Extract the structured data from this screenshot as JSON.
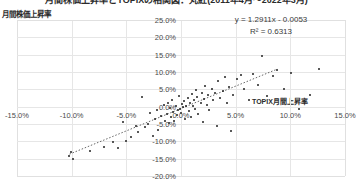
{
  "chart_data": {
    "type": "scatter",
    "title": "月間株価上昇率とTOPIXの相関図：丸紅(2011年4月～2022年3月)",
    "xlabel": "TOPIX月間上昇率",
    "ylabel": "月間株価上昇率",
    "xlim": [
      -0.15,
      0.15
    ],
    "ylim": [
      -0.2,
      0.25
    ],
    "xticks": [
      "-15.0%",
      "-10.0%",
      "-5.0%",
      "0.0%",
      "5.0%",
      "10.0%",
      "15.0%"
    ],
    "xtick_values": [
      -0.15,
      -0.1,
      -0.05,
      0.0,
      0.05,
      0.1,
      0.15
    ],
    "yticks": [
      "25.0%",
      "20.0%",
      "15.0%",
      "10.0%",
      "5.0%",
      "0.0%",
      "-5.0%",
      "-10.0%",
      "-15.0%",
      "-20.0%"
    ],
    "ytick_values": [
      0.25,
      0.2,
      0.15,
      0.1,
      0.05,
      0.0,
      -0.05,
      -0.1,
      -0.15,
      -0.2
    ],
    "grid": true,
    "legend": "none",
    "annotations": {
      "equation": "y = 1.2911x - 0.0053",
      "r_squared": "R² = 0.6313"
    },
    "trendline": {
      "type": "linear",
      "slope": 1.2911,
      "intercept": -0.0053,
      "r2": 0.6313,
      "style": "dotted",
      "x_start": -0.102,
      "x_end": 0.088
    },
    "series": [
      {
        "name": "丸紅 月間株価上昇率 vs TOPIX月間上昇率",
        "marker": "dot",
        "color": "#222222",
        "points": [
          [
            -0.102,
            -0.142
          ],
          [
            -0.101,
            -0.131
          ],
          [
            -0.099,
            -0.152
          ],
          [
            -0.083,
            -0.128
          ],
          [
            -0.07,
            -0.116
          ],
          [
            -0.062,
            -0.102
          ],
          [
            -0.058,
            -0.119
          ],
          [
            -0.053,
            -0.045
          ],
          [
            -0.05,
            -0.098
          ],
          [
            -0.046,
            -0.088
          ],
          [
            -0.041,
            -0.056
          ],
          [
            -0.039,
            -0.072
          ],
          [
            -0.036,
            0.028
          ],
          [
            -0.033,
            -0.06
          ],
          [
            -0.03,
            -0.05
          ],
          [
            -0.028,
            -0.019
          ],
          [
            -0.026,
            -0.086
          ],
          [
            -0.024,
            -0.035
          ],
          [
            -0.022,
            -0.009
          ],
          [
            -0.021,
            -0.066
          ],
          [
            -0.018,
            -0.028
          ],
          [
            -0.016,
            0.005
          ],
          [
            -0.015,
            -0.042
          ],
          [
            -0.013,
            -0.022
          ],
          [
            -0.012,
            0.012
          ],
          [
            -0.011,
            -0.048
          ],
          [
            -0.01,
            -0.004
          ],
          [
            -0.009,
            -0.031
          ],
          [
            -0.008,
            0.02
          ],
          [
            -0.007,
            -0.016
          ],
          [
            -0.006,
            -0.04
          ],
          [
            -0.005,
            0.002
          ],
          [
            -0.004,
            -0.025
          ],
          [
            -0.003,
            -0.011
          ],
          [
            -0.002,
            0.03
          ],
          [
            -0.001,
            -0.006
          ],
          [
            0.0,
            -0.018
          ],
          [
            0.001,
            0.008
          ],
          [
            0.002,
            -0.002
          ],
          [
            0.003,
            0.016
          ],
          [
            0.004,
            -0.037
          ],
          [
            0.005,
            0.001
          ],
          [
            0.006,
            0.024
          ],
          [
            0.007,
            -0.013
          ],
          [
            0.008,
            0.01
          ],
          [
            0.009,
            -0.029
          ],
          [
            0.01,
            0.036
          ],
          [
            0.011,
            0.003
          ],
          [
            0.012,
            0.018
          ],
          [
            0.013,
            -0.008
          ],
          [
            0.014,
            0.048
          ],
          [
            0.015,
            0.027
          ],
          [
            0.016,
            -0.02
          ],
          [
            0.018,
            0.012
          ],
          [
            0.019,
            0.04
          ],
          [
            0.02,
            -0.044
          ],
          [
            0.021,
            0.021
          ],
          [
            0.022,
            0.06
          ],
          [
            0.024,
            0.005
          ],
          [
            0.025,
            0.033
          ],
          [
            0.026,
            -0.011
          ],
          [
            0.028,
            0.051
          ],
          [
            0.029,
            0.018
          ],
          [
            0.031,
            0.038
          ],
          [
            0.033,
            -0.055
          ],
          [
            0.034,
            0.073
          ],
          [
            0.036,
            0.026
          ],
          [
            0.038,
            0.044
          ],
          [
            0.04,
            0.085
          ],
          [
            0.042,
            0.012
          ],
          [
            0.044,
            0.058
          ],
          [
            0.046,
            -0.07
          ],
          [
            0.048,
            0.035
          ],
          [
            0.051,
            0.08
          ],
          [
            0.055,
            0.09
          ],
          [
            0.058,
            0.05
          ],
          [
            0.062,
            0.02
          ],
          [
            0.066,
            0.095
          ],
          [
            0.07,
            0.062
          ],
          [
            0.074,
            0.145
          ],
          [
            0.079,
            0.03
          ],
          [
            0.084,
            0.088
          ],
          [
            0.088,
            0.105
          ],
          [
            0.094,
            0.05
          ],
          [
            0.101,
            0.098
          ],
          [
            0.108,
            -0.008
          ],
          [
            0.118,
            0.035
          ],
          [
            0.126,
            0.108
          ]
        ]
      }
    ]
  }
}
